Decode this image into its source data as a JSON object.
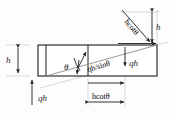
{
  "figure": {
    "type": "engineering-line-diagram",
    "background_color": "#fdfdfd",
    "line_color": "#1d1d1d",
    "guide_line_color": "#c9c9c9",
    "frame_fill": "#ffffff"
  },
  "labels": {
    "height_left": "h",
    "height_right": "h",
    "angle": "θ",
    "load_bottom_left": "qh",
    "load_right": "qh",
    "load_diagonal": "qh/sinθ",
    "span_bottom": "hcotθ",
    "span_top_right": "hcotθ"
  },
  "geometry": {
    "frame_left_x": 38,
    "frame_right_x": 157,
    "frame_top_y": 45,
    "frame_bottom_y": 76,
    "vertical_member_1_x": 46,
    "vertical_member_2_x": 88,
    "diagonal_start": [
      46,
      76
    ],
    "diagonal_end": [
      157,
      45
    ],
    "span_dim_left_x": 88,
    "span_dim_right_x": 125
  },
  "icons": {
    "arrow_up": "arrow-up",
    "arrow_down": "arrow-down",
    "arrow_right": "arrow-right",
    "arrow_diagonal": "arrow-diagonal",
    "dimension_double_arrow": "double-headed-arrow",
    "angle_arc": "angle-arc"
  }
}
